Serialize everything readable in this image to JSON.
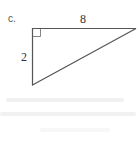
{
  "figure": {
    "part_label": "c.",
    "shape": "right-triangle",
    "right_angle_marker": true,
    "sides": {
      "top": "8",
      "left": "2"
    },
    "stroke_color": "#555555"
  }
}
